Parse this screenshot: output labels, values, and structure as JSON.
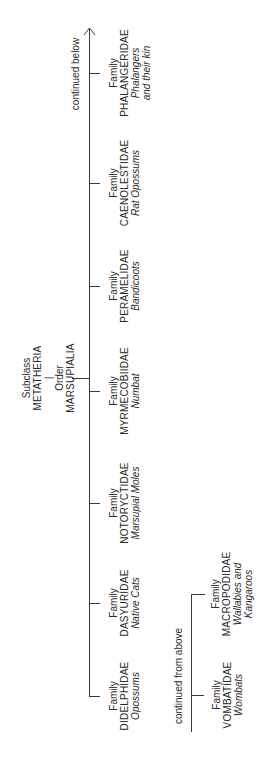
{
  "root": {
    "subclass_label": "Subclass",
    "subclass_name": "METATHERIA",
    "order_label": "Order",
    "order_name": "MARSUPIALIA"
  },
  "notes": {
    "continued_below": "continued below",
    "continued_from_above": "continued from above"
  },
  "families": [
    {
      "label": "Family",
      "name": "PHALANGERIDAE",
      "common": [
        "Phalangers",
        "and their kin"
      ]
    },
    {
      "label": "Family",
      "name": "CAENOLESTIDAE",
      "common": [
        "Rat Opossums"
      ]
    },
    {
      "label": "Family",
      "name": "PERAMELIDAE",
      "common": [
        "Bandicoots"
      ]
    },
    {
      "label": "Family",
      "name": "MYRMECOBIIDAE",
      "common": [
        "Numbat"
      ]
    },
    {
      "label": "Family",
      "name": "NOTORYCTIDAE",
      "common": [
        "Marsupial Moles"
      ]
    },
    {
      "label": "Family",
      "name": "DASYURIDAE",
      "common": [
        "Native Cats"
      ]
    },
    {
      "label": "Family",
      "name": "DIDELPHIDAE",
      "common": [
        "Opossums"
      ]
    },
    {
      "label": "Family",
      "name": "MACROPODIDAE",
      "common": [
        "Wallabies and",
        "Kangaroos"
      ]
    },
    {
      "label": "Family",
      "name": "VOMBATIDAE",
      "common": [
        "Wombats"
      ]
    }
  ]
}
